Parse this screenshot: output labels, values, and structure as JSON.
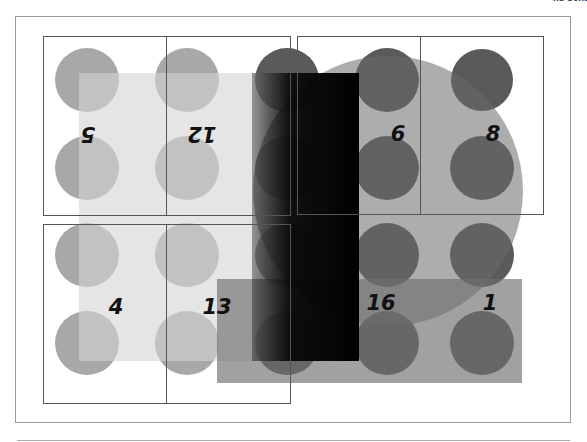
{
  "corner_label": "nu Cont",
  "colors": {
    "light_circle": "#a8a8a8",
    "dark_circle": "#3c3c3c",
    "light_square": "#e0e0e0",
    "black_bar": "#000000",
    "big_circle": "#8c8c8c",
    "gray_rect": "#7a7a7a",
    "box_stroke": "#555555"
  },
  "boxes": [
    {
      "x": 43,
      "y": 36,
      "w": 123,
      "h": 179
    },
    {
      "x": 166,
      "y": 36,
      "w": 124,
      "h": 179
    },
    {
      "x": 297,
      "y": 36,
      "w": 123,
      "h": 178
    },
    {
      "x": 420,
      "y": 36,
      "w": 123,
      "h": 178
    },
    {
      "x": 43,
      "y": 224,
      "w": 123,
      "h": 179
    },
    {
      "x": 166,
      "y": 224,
      "w": 124,
      "h": 179
    }
  ],
  "labels": [
    {
      "text": "5",
      "x": 88,
      "y": 127,
      "rotated": true
    },
    {
      "text": "12",
      "x": 202,
      "y": 127,
      "rotated": true
    },
    {
      "text": "6",
      "x": 398,
      "y": 141,
      "rotated": false
    },
    {
      "text": "8",
      "x": 493,
      "y": 141,
      "rotated": false
    },
    {
      "text": "4",
      "x": 116,
      "y": 314,
      "rotated": false
    },
    {
      "text": "13",
      "x": 217,
      "y": 314,
      "rotated": false
    },
    {
      "text": "16",
      "x": 381,
      "y": 310,
      "rotated": false
    },
    {
      "text": "1",
      "x": 490,
      "y": 310,
      "rotated": false
    }
  ]
}
